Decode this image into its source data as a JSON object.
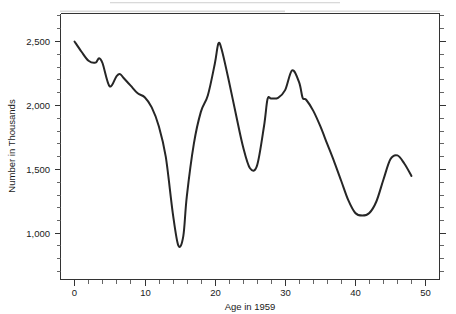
{
  "chart_data": {
    "type": "line",
    "title": "",
    "xlabel": "Age in 1959",
    "ylabel": "Number in Thousands",
    "xlim": [
      -2,
      52
    ],
    "ylim": [
      650,
      2720
    ],
    "grid": false,
    "legend": "none",
    "x_ticks_major": [
      0,
      10,
      20,
      30,
      40,
      50
    ],
    "x_tick_labels": [
      "0",
      "10",
      "20",
      "30",
      "40",
      "50"
    ],
    "x_tick_minor_step": 2,
    "y_ticks_major": [
      1000,
      1500,
      2000,
      2500
    ],
    "y_tick_labels": [
      "1,000",
      "1,500",
      "2,000",
      "2,500"
    ],
    "y_tick_minor_step": 100,
    "series_name": "Population by age",
    "x": [
      0,
      1,
      2,
      3,
      3.5,
      4,
      5,
      6,
      6.5,
      7,
      8,
      9,
      10,
      11,
      12,
      13,
      14,
      14.8,
      15.5,
      16,
      17,
      18,
      19,
      20,
      20.5,
      21,
      22,
      23,
      24,
      25,
      26,
      27,
      27.5,
      28,
      29,
      30,
      31,
      32,
      32.5,
      33,
      34,
      35,
      36,
      37,
      38,
      39,
      40,
      41,
      42,
      43,
      44,
      45,
      46,
      47,
      48
    ],
    "y": [
      2500,
      2420,
      2350,
      2335,
      2370,
      2330,
      2150,
      2230,
      2245,
      2215,
      2155,
      2095,
      2065,
      1985,
      1840,
      1600,
      1160,
      905,
      980,
      1290,
      1700,
      1950,
      2080,
      2330,
      2485,
      2430,
      2190,
      1930,
      1680,
      1510,
      1530,
      1840,
      2050,
      2055,
      2060,
      2120,
      2275,
      2180,
      2060,
      2045,
      1960,
      1840,
      1700,
      1560,
      1410,
      1260,
      1160,
      1140,
      1160,
      1250,
      1420,
      1580,
      1610,
      1545,
      1450
    ],
    "x_axis_labels": {
      "t0": "0",
      "t10": "10",
      "t20": "20",
      "t30": "30",
      "t40": "40",
      "t50": "50"
    },
    "y_axis_labels": {
      "t1000": "1,000",
      "t1500": "1,500",
      "t2000": "2,000",
      "t2500": "2,500"
    },
    "line_color": "#262626",
    "axis_color": "#333333",
    "background_color": "#ffffff"
  }
}
